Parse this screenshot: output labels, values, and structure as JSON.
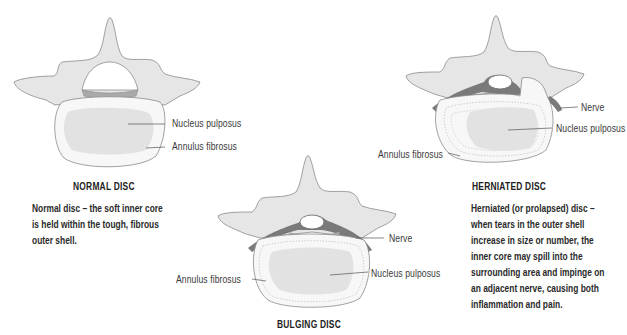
{
  "colors": {
    "bone_fill": "#e6e6e6",
    "bone_stroke": "#8a8a8a",
    "disc_fill": "#f7f7f7",
    "nucleus_fill": "#e2e2e2",
    "nerve_fill": "#7a7a7a",
    "endplate_fill": "#a9a9a9",
    "text": "#2a2a2a"
  },
  "panels": {
    "normal": {
      "title": "NORMAL DISC",
      "labels": {
        "nucleus": "Nucleus pulposus",
        "annulus": "Annulus fibrosus"
      },
      "description": [
        "Normal disc – the soft inner core",
        "is held within the tough, fibrous",
        "outer shell."
      ]
    },
    "bulging": {
      "title": "BULGING DISC",
      "labels": {
        "nerve": "Nerve",
        "nucleus": "Nucleus pulposus",
        "annulus": "Annulus fibrosus"
      }
    },
    "herniated": {
      "title": "HERNIATED DISC",
      "labels": {
        "nerve": "Nerve",
        "nucleus": "Nucleus pulposus",
        "annulus": "Annulus fibrosus"
      },
      "description": [
        "Herniated (or prolapsed) disc –",
        "when tears in the outer shell",
        "increase in size or number, the",
        "inner core may spill into the",
        "surrounding area and impinge on",
        "an adjacent nerve, causing both",
        "inflammation and pain."
      ]
    }
  }
}
